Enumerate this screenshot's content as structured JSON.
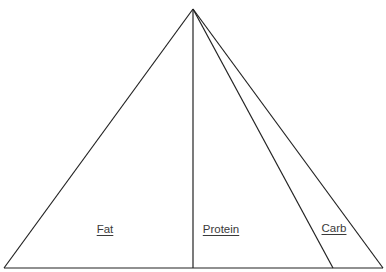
{
  "diagram": {
    "type": "macronutrient-pyramid",
    "stroke_color": "#222222",
    "apex": {
      "x": 193,
      "y": 9
    },
    "base": {
      "y": 268,
      "left_x": 4,
      "right_x": 383
    },
    "dividers": [
      {
        "name": "fat-protein-divider",
        "base_x": 193
      },
      {
        "name": "protein-carb-divider",
        "base_x": 333
      }
    ],
    "sections": [
      {
        "label": "Fat",
        "label_x": 105,
        "label_y": 224
      },
      {
        "label": "Protein",
        "label_x": 221,
        "label_y": 224
      },
      {
        "label": "Carb",
        "label_x": 334,
        "label_y": 223
      }
    ]
  }
}
